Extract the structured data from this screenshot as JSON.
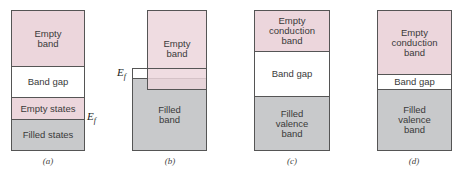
{
  "figure": {
    "colors": {
      "empty": "#ecd6dc",
      "gap": "#ffffff",
      "filled": "#c8c9cb",
      "border": "#555555"
    },
    "panels": [
      {
        "caption": "(a)",
        "bands": [
          {
            "label": "Empty band",
            "fill": "empty"
          },
          {
            "label": "Band gap",
            "fill": "gap"
          },
          {
            "label": "Empty states",
            "fill": "empty"
          },
          {
            "label": "Filled states",
            "fill": "filled"
          }
        ],
        "fermi_label": "E",
        "fermi_sub": "f"
      },
      {
        "caption": "(b)",
        "bands": [
          {
            "label": "Empty band",
            "fill": "empty"
          },
          {
            "label": "Filled band",
            "fill": "filled"
          }
        ],
        "fermi_label": "E",
        "fermi_sub": "f"
      },
      {
        "caption": "(c)",
        "bands": [
          {
            "label": "Empty conduction band",
            "fill": "empty"
          },
          {
            "label": "Band gap",
            "fill": "gap"
          },
          {
            "label": "Filled valence band",
            "fill": "filled"
          }
        ]
      },
      {
        "caption": "(d)",
        "bands": [
          {
            "label": "Empty conduction band",
            "fill": "empty"
          },
          {
            "label": "Band gap",
            "fill": "gap"
          },
          {
            "label": "Filled valence band",
            "fill": "filled"
          }
        ]
      }
    ]
  }
}
